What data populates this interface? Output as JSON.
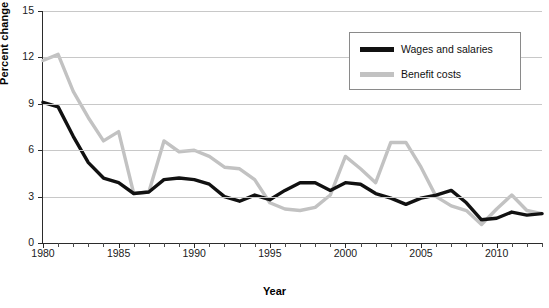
{
  "chart_data": {
    "type": "line",
    "title": "",
    "xlabel": "Year",
    "ylabel": "Percent change",
    "xlim": [
      1980,
      2013
    ],
    "ylim": [
      0,
      15
    ],
    "yticks": [
      0,
      3,
      6,
      9,
      12,
      15
    ],
    "xticks_major": [
      1980,
      1985,
      1990,
      1995,
      2000,
      2005,
      2010
    ],
    "xtick_minor_step": 1,
    "grid": "horizontal",
    "legend_position": "top-right",
    "x": [
      1980,
      1981,
      1982,
      1983,
      1984,
      1985,
      1986,
      1987,
      1988,
      1989,
      1990,
      1991,
      1992,
      1993,
      1994,
      1995,
      1996,
      1997,
      1998,
      1999,
      2000,
      2001,
      2002,
      2003,
      2004,
      2005,
      2006,
      2007,
      2008,
      2009,
      2010,
      2011,
      2012,
      2013
    ],
    "series": [
      {
        "name": "Wages and salaries",
        "color": "#111111",
        "width": 3.4,
        "values": [
          9.1,
          8.8,
          6.9,
          5.2,
          4.2,
          3.9,
          3.2,
          3.3,
          4.1,
          4.2,
          4.1,
          3.8,
          3.0,
          2.7,
          3.1,
          2.8,
          3.4,
          3.9,
          3.9,
          3.4,
          3.9,
          3.8,
          3.2,
          2.9,
          2.5,
          2.9,
          3.1,
          3.4,
          2.6,
          1.5,
          1.6,
          2.0,
          1.8,
          1.9
        ]
      },
      {
        "name": "Benefit costs",
        "color": "#c2c2c2",
        "width": 3.4,
        "values": [
          11.8,
          12.2,
          9.8,
          8.1,
          6.6,
          7.2,
          3.2,
          3.3,
          6.6,
          5.9,
          6.0,
          5.6,
          4.9,
          4.8,
          4.1,
          2.6,
          2.2,
          2.1,
          2.3,
          3.1,
          5.6,
          4.8,
          3.9,
          6.5,
          6.5,
          4.9,
          3.0,
          2.4,
          2.1,
          1.2,
          2.2,
          3.1,
          2.1,
          1.9
        ]
      }
    ]
  },
  "legend": {
    "items": [
      {
        "label": "Wages and salaries",
        "color": "#111111"
      },
      {
        "label": "Benefit costs",
        "color": "#c2c2c2"
      }
    ]
  }
}
